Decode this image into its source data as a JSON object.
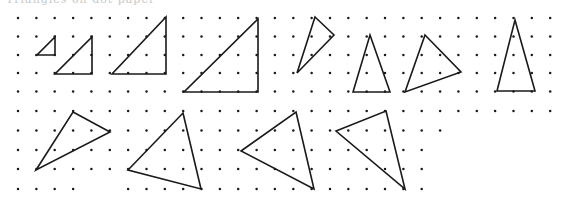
{
  "caption": {
    "text": "Triangles on dot paper"
  },
  "colors": {
    "ink": "#1a1a1a",
    "paper": "#ffffff"
  },
  "grid": {
    "pitch": 18.35,
    "x0": 18,
    "top_rows_y": [
      18,
      36.5,
      55,
      73,
      91.5
    ],
    "top_cols": 30,
    "bottom_rows_y": [
      111,
      130.5,
      150,
      169,
      189
    ],
    "bottom_row_cols": [
      30,
      24,
      23,
      23,
      23
    ],
    "bottom_row5_gaps": [
      4,
      5
    ]
  },
  "triangles": [
    {
      "id": 1,
      "points": [
        [
          55,
          37
        ],
        [
          55,
          55
        ],
        [
          37,
          55
        ]
      ]
    },
    {
      "id": 2,
      "points": [
        [
          92,
          37
        ],
        [
          92,
          74
        ],
        [
          55,
          74
        ]
      ]
    },
    {
      "id": 3,
      "points": [
        [
          166,
          17
        ],
        [
          166,
          74
        ],
        [
          112,
          74
        ]
      ]
    },
    {
      "id": 4,
      "points": [
        [
          258,
          19
        ],
        [
          258,
          92
        ],
        [
          184,
          92
        ]
      ]
    },
    {
      "id": 5,
      "points": [
        [
          315,
          17
        ],
        [
          334,
          35
        ],
        [
          297,
          73
        ]
      ]
    },
    {
      "id": 6,
      "points": [
        [
          370,
          35
        ],
        [
          390,
          92
        ],
        [
          353,
          92
        ]
      ]
    },
    {
      "id": 7,
      "points": [
        [
          425,
          35
        ],
        [
          461,
          72
        ],
        [
          405,
          92
        ]
      ]
    },
    {
      "id": 8,
      "points": [
        [
          515,
          20
        ],
        [
          535,
          91
        ],
        [
          497,
          91
        ]
      ]
    },
    {
      "id": 9,
      "points": [
        [
          73,
          112
        ],
        [
          110,
          132
        ],
        [
          36,
          170
        ]
      ]
    },
    {
      "id": 10,
      "points": [
        [
          183,
          113
        ],
        [
          201,
          189
        ],
        [
          128,
          170
        ]
      ]
    },
    {
      "id": 11,
      "points": [
        [
          296,
          112
        ],
        [
          314,
          189
        ],
        [
          241,
          151
        ]
      ]
    },
    {
      "id": 12,
      "points": [
        [
          386,
          111
        ],
        [
          405,
          189
        ],
        [
          336,
          131
        ]
      ]
    }
  ]
}
